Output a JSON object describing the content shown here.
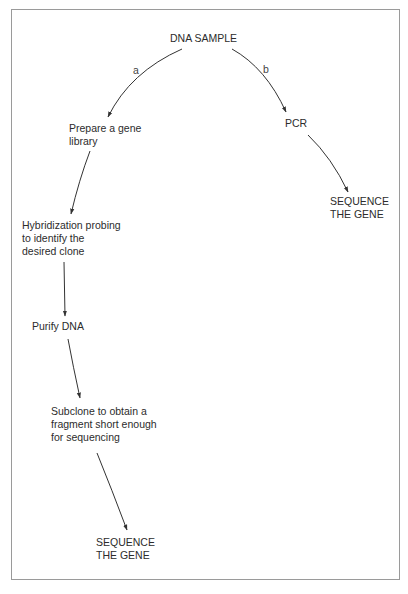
{
  "diagram": {
    "type": "flowchart",
    "root": "DNA SAMPLE",
    "branches": [
      {
        "label": "a",
        "steps": [
          "Prepare a gene\nlibrary",
          "Hybridization probing\nto identify the\ndesired clone",
          "Purify DNA",
          "Subclone to obtain a\nfragment short enough\nfor sequencing",
          "SEQUENCE\nTHE GENE"
        ]
      },
      {
        "label": "b",
        "steps": [
          "PCR",
          "SEQUENCE\nTHE GENE"
        ]
      }
    ]
  },
  "colors": {
    "line": "#333333",
    "text": "#2c2c2c",
    "frame": "#9a9a9a",
    "background": "#ffffff"
  }
}
